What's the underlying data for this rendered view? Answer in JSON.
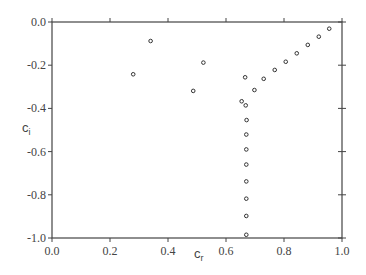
{
  "chart_data": {
    "type": "scatter",
    "title": "",
    "xlabel": "c_r",
    "ylabel": "c_i",
    "xlabel_main": "c",
    "xlabel_sub": "r",
    "ylabel_main": "c",
    "ylabel_sub": "i",
    "xlim": [
      0.0,
      1.0
    ],
    "ylim": [
      -1.0,
      0.0
    ],
    "grid": false,
    "legend": null,
    "x_ticks": [
      0.0,
      0.2,
      0.4,
      0.6,
      0.8,
      1.0
    ],
    "x_tick_labels": [
      "0.0",
      "0.2",
      "0.4",
      "0.6",
      "0.8",
      "1.0"
    ],
    "y_ticks": [
      0.0,
      -0.2,
      -0.4,
      -0.6,
      -0.8,
      -1.0
    ],
    "y_tick_labels": [
      "0.0",
      "-0.2",
      "-0.4",
      "-0.6",
      "-0.8",
      "-1.0"
    ],
    "marker": "open-circle",
    "series": [
      {
        "name": "eigenvalues",
        "points": [
          {
            "x": 0.28,
            "y": -0.242
          },
          {
            "x": 0.34,
            "y": -0.088
          },
          {
            "x": 0.487,
            "y": -0.319
          },
          {
            "x": 0.522,
            "y": -0.188
          },
          {
            "x": 0.956,
            "y": -0.031
          },
          {
            "x": 0.92,
            "y": -0.068
          },
          {
            "x": 0.882,
            "y": -0.106
          },
          {
            "x": 0.844,
            "y": -0.145
          },
          {
            "x": 0.806,
            "y": -0.184
          },
          {
            "x": 0.768,
            "y": -0.222
          },
          {
            "x": 0.73,
            "y": -0.263
          },
          {
            "x": 0.698,
            "y": -0.315
          },
          {
            "x": 0.666,
            "y": -0.256
          },
          {
            "x": 0.654,
            "y": -0.367
          },
          {
            "x": 0.668,
            "y": -0.386
          },
          {
            "x": 0.671,
            "y": -0.454
          },
          {
            "x": 0.67,
            "y": -0.521
          },
          {
            "x": 0.67,
            "y": -0.59
          },
          {
            "x": 0.67,
            "y": -0.66
          },
          {
            "x": 0.67,
            "y": -0.738
          },
          {
            "x": 0.67,
            "y": -0.818
          },
          {
            "x": 0.67,
            "y": -0.898
          },
          {
            "x": 0.67,
            "y": -0.985
          }
        ]
      }
    ]
  },
  "colors": {
    "axis": "#444444",
    "marker_stroke": "#333333",
    "background": "#ffffff"
  }
}
